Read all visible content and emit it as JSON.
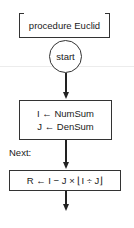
{
  "flowchart": {
    "procedure": {
      "label": "procedure Euclid"
    },
    "start": {
      "label": "start"
    },
    "init_block": {
      "lines": [
        "I ← NumSum",
        "J ← DenSum"
      ]
    },
    "next_label": "Next:",
    "remainder_block": {
      "formula": "R ← I − J × ⌊I ÷ J⌋"
    },
    "colors": {
      "stroke": "#333333",
      "arrow": "#222222",
      "background": "#ffffff",
      "text": "#1a1a1a"
    }
  }
}
